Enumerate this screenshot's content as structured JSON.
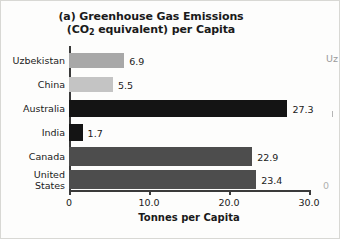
{
  "figure": {
    "panel_label": "(a)",
    "background_color": "#fdfdfc",
    "border_color": "#d8d8d4"
  },
  "title": {
    "line1": "(a) Greenhouse Gas Emissions",
    "line2_before": "(CO",
    "line2_sub": "2",
    "line2_after": " equivalent) per Capita",
    "full": "(a) Greenhouse Gas Emissions (CO2 equivalent) per Capita"
  },
  "axis": {
    "x_title": "Tonnes per Capita",
    "x_ticks": [
      "0",
      "10.0",
      "20.0",
      "30.0"
    ],
    "x_tick_values": [
      0,
      10,
      20,
      30
    ],
    "x_min": 0,
    "x_max": 30
  },
  "adjacent_panel": {
    "cut_label": "Uz",
    "cut_zero": "0"
  },
  "chart_data": {
    "type": "bar",
    "orientation": "horizontal",
    "title": "(a) Greenhouse Gas Emissions (CO2 equivalent) per Capita",
    "xlabel": "Tonnes per Capita",
    "ylabel": "",
    "xlim": [
      0,
      30
    ],
    "grid": false,
    "legend": "none",
    "categories": [
      "Uzbekistan",
      "China",
      "Australia",
      "India",
      "Canada",
      "United States"
    ],
    "values": [
      6.9,
      5.5,
      27.3,
      1.7,
      22.9,
      23.4
    ],
    "value_labels": [
      "6.9",
      "5.5",
      "27.3",
      "1.7",
      "22.9",
      "23.4"
    ],
    "bar_colors": [
      "#a8a8a8",
      "#c4c4c4",
      "#141414",
      "#141414",
      "#4d4d4d",
      "#4d4d4d"
    ],
    "bars": [
      {
        "label": "Uzbekistan",
        "value": 6.9,
        "value_label": "6.9",
        "color": "#a8a8a8"
      },
      {
        "label": "China",
        "value": 5.5,
        "value_label": "5.5",
        "color": "#c4c4c4"
      },
      {
        "label": "Australia",
        "value": 27.3,
        "value_label": "27.3",
        "color": "#141414"
      },
      {
        "label": "India",
        "value": 1.7,
        "value_label": "1.7",
        "color": "#141414"
      },
      {
        "label": "Canada",
        "value": 22.9,
        "value_label": "22.9",
        "color": "#4d4d4d"
      },
      {
        "label": "United\nStates",
        "value": 23.4,
        "value_label": "23.4",
        "color": "#4d4d4d"
      }
    ]
  }
}
